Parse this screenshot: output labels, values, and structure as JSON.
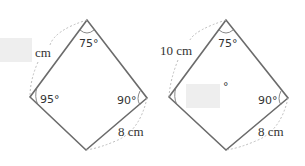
{
  "figures": [
    {
      "id": "left",
      "angles": {
        "top": "75°",
        "left": "95°",
        "right": "90°"
      },
      "sides": {
        "top_left": "cm",
        "bottom_right": "8 cm"
      },
      "blank_box": "top_left_length"
    },
    {
      "id": "right",
      "angles": {
        "top": "75°",
        "left": "°",
        "right": "90°"
      },
      "sides": {
        "top_left": "10 cm",
        "bottom_right": "8 cm"
      },
      "blank_box": "left_angle"
    }
  ],
  "colors": {
    "edge": "#6b6b6b",
    "blank": "#eeeeee",
    "text": "#333333"
  }
}
